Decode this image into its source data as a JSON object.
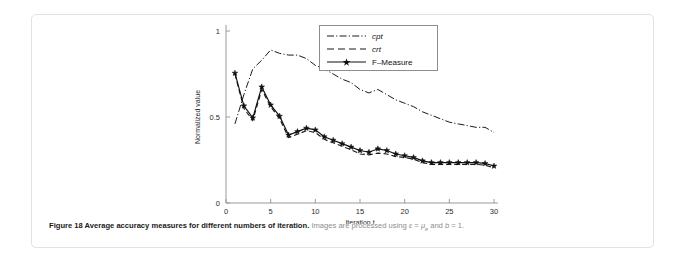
{
  "figure": {
    "caption_bold": "Figure 18 Average accuracy measures for different numbers of iteration.",
    "caption_rest_a": "Images are processed using ",
    "caption_eps": "ε",
    "caption_eq1": " = ",
    "caption_mu": "μ",
    "caption_mu_sub": "e",
    "caption_rest_b": " and ",
    "caption_b": "b",
    "caption_eq2": " = 1."
  },
  "chart_data": {
    "type": "line",
    "title": "",
    "xlabel": "Iteration,t",
    "ylabel": "Normalized value",
    "xlim": [
      0,
      30
    ],
    "ylim": [
      0,
      1
    ],
    "xticks": [
      0,
      5,
      10,
      15,
      20,
      25,
      30
    ],
    "xticklabels": [
      "0",
      "5",
      "10",
      "15",
      "20",
      "25",
      "30"
    ],
    "yticks": [
      0,
      0.5,
      1
    ],
    "yticklabels": [
      "0",
      "0.5",
      "1"
    ],
    "grid": false,
    "legend_position": "upper-right",
    "x": [
      1,
      2,
      3,
      4,
      5,
      6,
      7,
      8,
      9,
      10,
      11,
      12,
      13,
      14,
      15,
      16,
      17,
      18,
      19,
      20,
      21,
      22,
      23,
      24,
      25,
      26,
      27,
      28,
      29,
      30
    ],
    "series": [
      {
        "name": "cpt",
        "style": "dash-dot",
        "marker": "none",
        "values": [
          0.46,
          0.63,
          0.78,
          0.83,
          0.89,
          0.87,
          0.86,
          0.86,
          0.84,
          0.8,
          0.78,
          0.75,
          0.72,
          0.7,
          0.66,
          0.64,
          0.66,
          0.63,
          0.6,
          0.58,
          0.56,
          0.53,
          0.51,
          0.49,
          0.47,
          0.46,
          0.45,
          0.44,
          0.44,
          0.41
        ]
      },
      {
        "name": "crt",
        "style": "dashed",
        "marker": "none",
        "values": [
          0.75,
          0.55,
          0.48,
          0.66,
          0.56,
          0.49,
          0.38,
          0.4,
          0.42,
          0.41,
          0.37,
          0.35,
          0.33,
          0.31,
          0.285,
          0.28,
          0.29,
          0.285,
          0.27,
          0.265,
          0.255,
          0.235,
          0.225,
          0.225,
          0.225,
          0.225,
          0.225,
          0.225,
          0.22,
          0.205
        ]
      },
      {
        "name": "F–Measure",
        "style": "solid",
        "marker": "star",
        "values": [
          0.755,
          0.565,
          0.495,
          0.675,
          0.57,
          0.505,
          0.395,
          0.415,
          0.435,
          0.425,
          0.385,
          0.365,
          0.345,
          0.325,
          0.305,
          0.295,
          0.315,
          0.305,
          0.285,
          0.275,
          0.265,
          0.245,
          0.235,
          0.235,
          0.235,
          0.235,
          0.235,
          0.235,
          0.23,
          0.215
        ]
      }
    ]
  },
  "legend": {
    "items": [
      {
        "label": "cpt",
        "italic": true
      },
      {
        "label": "crt",
        "italic": true
      },
      {
        "label": "F–Measure",
        "italic": false
      }
    ]
  }
}
